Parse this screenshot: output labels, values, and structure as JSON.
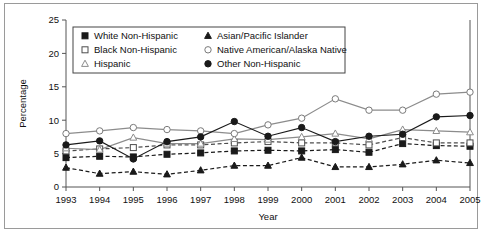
{
  "figure": {
    "background_color": "#ffffff",
    "border_color": "#9a9a9a"
  },
  "chart_data": {
    "type": "line",
    "title": "",
    "subtitle": "",
    "xlabel": "Year",
    "ylabel": "Percentage",
    "x": [
      1993,
      1994,
      1995,
      1996,
      1997,
      1998,
      1999,
      2000,
      2001,
      2002,
      2003,
      2004,
      2005
    ],
    "categories": [
      "1993",
      "1994",
      "1995",
      "1996",
      "1997",
      "1998",
      "1999",
      "2000",
      "2001",
      "2002",
      "2003",
      "2004",
      "2005"
    ],
    "xlim": [
      1993,
      2005
    ],
    "ylim": [
      0,
      25
    ],
    "yticks": [
      0,
      5,
      10,
      15,
      20,
      25
    ],
    "xticks": [
      "1993",
      "1994",
      "1995",
      "1996",
      "1997",
      "1998",
      "1999",
      "2000",
      "2001",
      "2002",
      "2003",
      "2004",
      "2005"
    ],
    "grid": false,
    "legend_position": "top-left-inside",
    "series": [
      {
        "name": "White Non-Hispanic",
        "marker": "filled-square",
        "line_style": "dashed",
        "color": "#1a1a1a",
        "values": [
          4.4,
          4.6,
          4.5,
          4.9,
          5.1,
          5.4,
          5.5,
          5.4,
          5.6,
          5.2,
          6.5,
          6.2,
          6.1
        ]
      },
      {
        "name": "Black Non-Hispanic",
        "marker": "open-square",
        "line_style": "dashed",
        "color": "#4d4d4d",
        "values": [
          5.4,
          5.7,
          5.9,
          6.3,
          6.3,
          6.6,
          6.8,
          6.6,
          6.6,
          6.3,
          7.4,
          6.6,
          6.6
        ]
      },
      {
        "name": "Hispanic",
        "marker": "open-triangle",
        "line_style": "solid",
        "color": "#8c8c8c",
        "values": [
          5.8,
          5.6,
          7.4,
          6.5,
          6.5,
          7.2,
          7.1,
          7.5,
          8.0,
          7.2,
          8.6,
          8.4,
          8.2
        ]
      },
      {
        "name": "Asian/Pacific Islander",
        "marker": "filled-triangle",
        "line_style": "dashed",
        "color": "#1a1a1a",
        "values": [
          2.9,
          2.0,
          2.3,
          1.9,
          2.5,
          3.2,
          3.2,
          4.4,
          3.0,
          3.0,
          3.4,
          4.0,
          3.6
        ]
      },
      {
        "name": "Native American/Alaska Native",
        "marker": "open-circle",
        "line_style": "solid",
        "color": "#8c8c8c",
        "values": [
          8.0,
          8.4,
          8.9,
          8.6,
          8.4,
          8.0,
          9.3,
          10.3,
          13.2,
          11.5,
          11.5,
          13.9,
          14.2
        ]
      },
      {
        "name": "Other Non-Hispanic",
        "marker": "filled-circle",
        "line_style": "solid",
        "color": "#1a1a1a",
        "values": [
          6.3,
          6.9,
          4.2,
          6.8,
          7.5,
          9.8,
          7.6,
          8.9,
          6.8,
          7.6,
          7.9,
          10.5,
          10.7
        ]
      }
    ]
  },
  "legend": {
    "entries": [
      {
        "label": "White Non-Hispanic",
        "marker": "filled-square"
      },
      {
        "label": "Black Non-Hispanic",
        "marker": "open-square"
      },
      {
        "label": "Hispanic",
        "marker": "open-triangle"
      },
      {
        "label": "Asian/Pacific Islander",
        "marker": "filled-triangle"
      },
      {
        "label": "Native American/Alaska Native",
        "marker": "open-circle"
      },
      {
        "label": "Other Non-Hispanic",
        "marker": "filled-circle"
      }
    ]
  }
}
